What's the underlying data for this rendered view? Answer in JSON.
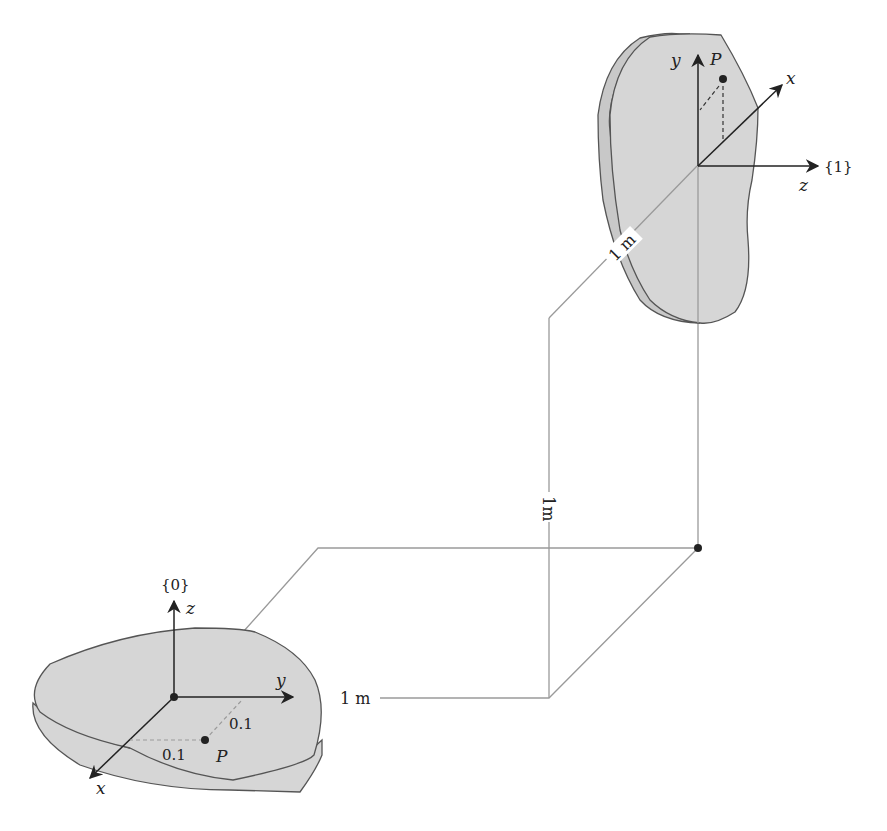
{
  "diagram": {
    "type": "coordinate-frames",
    "colors": {
      "body_fill": "#d6d6d6",
      "body_edge": "#555555",
      "axis": "#222222",
      "guide_line": "#9a9a9a",
      "background": "#ffffff"
    },
    "frame0": {
      "label": "{0}",
      "axes": {
        "x": "x",
        "y": "y",
        "z": "z"
      },
      "point_label": "P",
      "offset_along_y": "0.1",
      "offset_along_x": "0.1"
    },
    "frame1": {
      "label": "{1}",
      "axes": {
        "x": "x",
        "y": "y",
        "z": "z"
      },
      "point_label": "P"
    },
    "dimensions": {
      "horizontal": "1 m",
      "vertical": "1m",
      "diagonal": "1 m"
    }
  }
}
